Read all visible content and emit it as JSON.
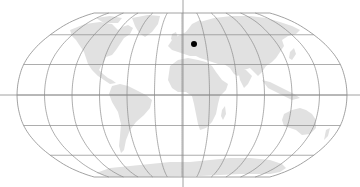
{
  "map": {
    "projection": "Robinson",
    "center_x": 182,
    "equator_y": 95,
    "half_width": 165,
    "half_height": 82,
    "graticule_step_deg": 30,
    "colors": {
      "land": "#e1e1e1",
      "grid": "#8a8a8a",
      "background": "#ffffff",
      "marker": "#000000"
    },
    "crosshair": {
      "x": 183,
      "y": 95,
      "vertical_from": 0,
      "vertical_to": 187,
      "horizontal_from": 0,
      "horizontal_to": 360
    },
    "marker": {
      "label": "selected-location",
      "x": 194,
      "y": 44,
      "r": 3
    }
  }
}
